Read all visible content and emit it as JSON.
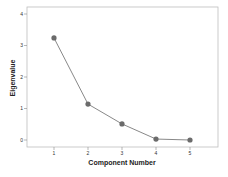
{
  "chart_data": {
    "type": "line",
    "title": "",
    "xlabel": "Component Number",
    "ylabel": "Eigenvalue",
    "categories": [
      "1",
      "2",
      "3",
      "4",
      "5"
    ],
    "x": [
      1,
      2,
      3,
      4,
      5
    ],
    "values": [
      3.24,
      1.14,
      0.51,
      0.03,
      0.0
    ],
    "series": [
      {
        "name": "Eigenvalue",
        "values": [
          3.24,
          1.14,
          0.51,
          0.03,
          0.0
        ]
      }
    ],
    "xlim": [
      0.3,
      5.8
    ],
    "ylim": [
      -0.2,
      4.2
    ],
    "yticks": [
      0,
      1,
      2,
      3,
      4
    ],
    "xticks": [
      1,
      2,
      3,
      4,
      5
    ],
    "grid": false,
    "legend": "none",
    "markers": true
  },
  "colors": {
    "line": "#7a7a7a",
    "marker": "#6b6b6b",
    "frame": "#bdbdbd",
    "text": "#222222"
  }
}
